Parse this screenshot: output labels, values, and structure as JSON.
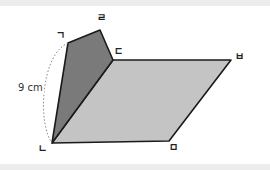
{
  "figure": {
    "colors": {
      "dark_face": "#7a7a7a",
      "light_face": "#c4c4c4",
      "edge": "#1a1a1a",
      "dotted_arc": "#888888",
      "band": "#ececec"
    },
    "vertices": {
      "giyeok": {
        "label": "ㄱ",
        "x": 68,
        "y": 43
      },
      "rieul": {
        "label": "ㄹ",
        "x": 100,
        "y": 30
      },
      "digeut": {
        "label": "ㄷ",
        "x": 113,
        "y": 60
      },
      "bieup": {
        "label": "ㅂ",
        "x": 231,
        "y": 60
      },
      "nieun": {
        "label": "ㄴ",
        "x": 52,
        "y": 143
      },
      "mieum": {
        "label": "ㅁ",
        "x": 169,
        "y": 141
      }
    },
    "dimension": {
      "label": "9 cm",
      "between": [
        "ㄱ",
        "ㄴ"
      ]
    }
  }
}
